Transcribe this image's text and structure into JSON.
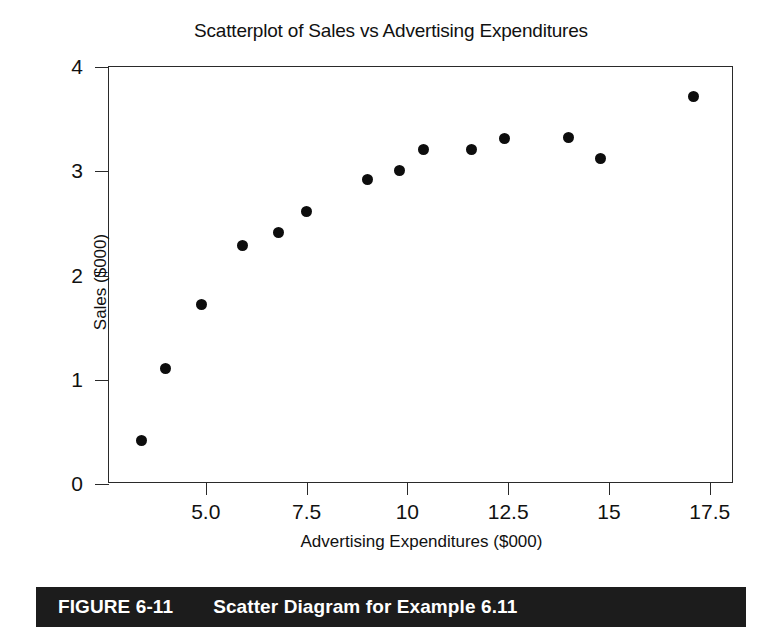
{
  "chart_data": {
    "type": "scatter",
    "title": "Scatterplot of Sales vs Advertising Expenditures",
    "xlabel": "Advertising Expenditures ($000)",
    "ylabel": "Sales ($000)",
    "xlim": [
      2.6,
      18.1
    ],
    "ylim": [
      0,
      4
    ],
    "xticks": [
      "5.0",
      "7.5",
      "10",
      "12.5",
      "15",
      "17.5"
    ],
    "xtick_values": [
      5.0,
      7.5,
      10,
      12.5,
      15,
      17.5
    ],
    "yticks": [
      "0",
      "1",
      "2",
      "3",
      "4"
    ],
    "ytick_values": [
      0,
      1,
      2,
      3,
      4
    ],
    "grid": false,
    "legend": null,
    "marker": "filled-circle",
    "marker_color": "#0d0d0d",
    "points": [
      {
        "x": 3.4,
        "y": 0.42
      },
      {
        "x": 4.0,
        "y": 1.11
      },
      {
        "x": 4.9,
        "y": 1.72
      },
      {
        "x": 5.9,
        "y": 2.29
      },
      {
        "x": 6.8,
        "y": 2.41
      },
      {
        "x": 7.5,
        "y": 2.61
      },
      {
        "x": 9.0,
        "y": 2.92
      },
      {
        "x": 9.8,
        "y": 3.01
      },
      {
        "x": 10.4,
        "y": 3.21
      },
      {
        "x": 11.6,
        "y": 3.21
      },
      {
        "x": 12.4,
        "y": 3.31
      },
      {
        "x": 14.0,
        "y": 3.32
      },
      {
        "x": 14.8,
        "y": 3.12
      },
      {
        "x": 17.1,
        "y": 3.72
      }
    ]
  },
  "caption": {
    "figure_number": "FIGURE 6-11",
    "title": "Scatter Diagram for Example 6.11",
    "background_color": "#1c1c1c",
    "text_color": "#ffffff"
  }
}
